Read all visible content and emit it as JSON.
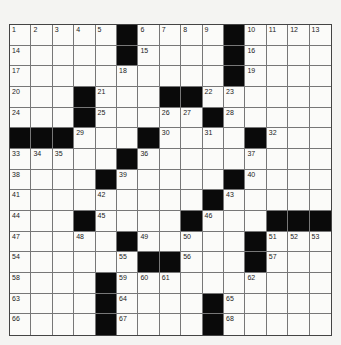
{
  "puzzle": {
    "rows": 15,
    "cols": 15,
    "colors": {
      "black": "#0a0a0a",
      "white": "#fbfbf9",
      "line": "#777777"
    },
    "grid": [
      [
        "1",
        "2",
        "3",
        "4",
        "5",
        "#",
        "6",
        "7",
        "8",
        "9",
        "#",
        "10",
        "11",
        "12",
        "13"
      ],
      [
        "14",
        ".",
        ".",
        ".",
        ".",
        "#",
        "15",
        ".",
        ".",
        ".",
        "#",
        "16",
        ".",
        ".",
        "."
      ],
      [
        "17",
        ".",
        ".",
        ".",
        ".",
        "18",
        ".",
        ".",
        ".",
        ".",
        "#",
        "19",
        ".",
        ".",
        "."
      ],
      [
        "20",
        ".",
        ".",
        "#",
        "21",
        ".",
        ".",
        "#",
        "#",
        "22",
        "23",
        ".",
        ".",
        ".",
        "."
      ],
      [
        "24",
        ".",
        ".",
        "#",
        "25",
        ".",
        ".",
        "26",
        "27",
        "#",
        "28",
        ".",
        ".",
        ".",
        "."
      ],
      [
        "#",
        "#",
        "#",
        "29",
        ".",
        ".",
        "#",
        "30",
        ".",
        "31",
        ".",
        "#",
        "32",
        ".",
        "."
      ],
      [
        "33",
        "34",
        "35",
        ".",
        ".",
        "#",
        "36",
        ".",
        ".",
        ".",
        ".",
        "37",
        ".",
        ".",
        "."
      ],
      [
        "38",
        ".",
        ".",
        ".",
        "#",
        "39",
        ".",
        ".",
        ".",
        ".",
        "#",
        "40",
        ".",
        ".",
        "."
      ],
      [
        "41",
        ".",
        ".",
        ".",
        "42",
        ".",
        ".",
        ".",
        ".",
        "#",
        "43",
        ".",
        ".",
        ".",
        "."
      ],
      [
        "44",
        ".",
        ".",
        "#",
        "45",
        ".",
        ".",
        ".",
        "#",
        "46",
        ".",
        ".",
        "#",
        "#",
        "#"
      ],
      [
        "47",
        ".",
        ".",
        "48",
        ".",
        "#",
        "49",
        ".",
        "50",
        ".",
        ".",
        "#",
        "51",
        "52",
        "53"
      ],
      [
        "54",
        ".",
        ".",
        ".",
        ".",
        "55",
        "#",
        "#",
        "56",
        ".",
        ".",
        "#",
        "57",
        ".",
        "."
      ],
      [
        "58",
        ".",
        ".",
        ".",
        "#",
        "59",
        "60",
        "61",
        ".",
        ".",
        ".",
        "62",
        ".",
        ".",
        "."
      ],
      [
        "63",
        ".",
        ".",
        ".",
        "#",
        "64",
        ".",
        ".",
        ".",
        "#",
        "65",
        ".",
        ".",
        ".",
        "."
      ],
      [
        "66",
        ".",
        ".",
        ".",
        "#",
        "67",
        ".",
        ".",
        ".",
        "#",
        "68",
        ".",
        ".",
        ".",
        "."
      ]
    ]
  }
}
